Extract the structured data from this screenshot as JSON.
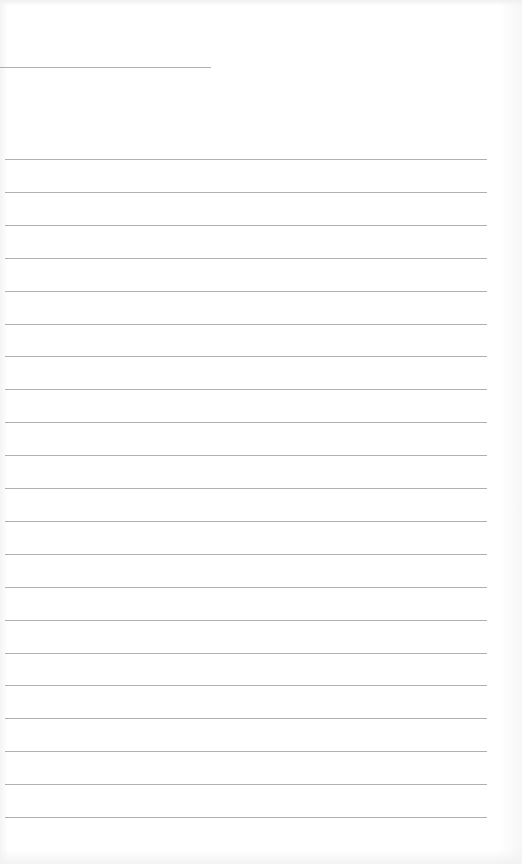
{
  "page": {
    "type": "blank lined paper",
    "background_color": "#ffffff",
    "line_color": "#b0b0b0",
    "header_line": {
      "x": 0,
      "y": 67,
      "width": 211
    },
    "rules": {
      "count": 21,
      "start_y": 159,
      "spacing": 32.9,
      "x": 5,
      "width": 482
    }
  }
}
